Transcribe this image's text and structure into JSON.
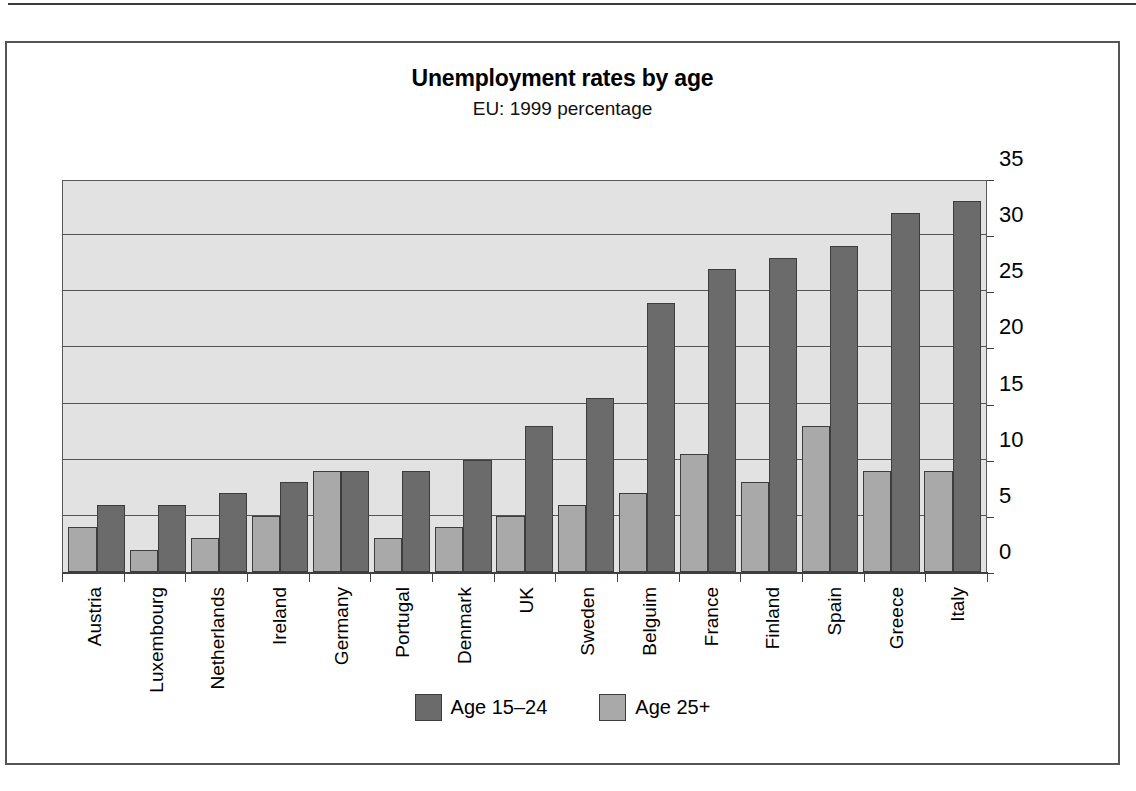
{
  "chart_data": {
    "type": "bar",
    "title": "Unemployment rates by age",
    "subtitle": "EU: 1999 percentage",
    "xlabel": "",
    "ylabel": "",
    "ylim": [
      0,
      35
    ],
    "yticks": [
      0,
      5,
      10,
      15,
      20,
      25,
      30,
      35
    ],
    "grid": true,
    "legend_position": "bottom",
    "categories": [
      "Austria",
      "Luxembourg",
      "Netherlands",
      "Ireland",
      "Germany",
      "Portugal",
      "Denmark",
      "UK",
      "Sweden",
      "Belguim",
      "France",
      "Finland",
      "Spain",
      "Greece",
      "Italy"
    ],
    "series": [
      {
        "name": "Age 25+",
        "color": "#a9a9a9",
        "values": [
          4,
          2,
          3,
          5,
          9,
          3,
          4,
          5,
          6,
          7,
          10.5,
          8,
          13,
          9,
          9
        ]
      },
      {
        "name": "Age 15–24",
        "color": "#6b6b6b",
        "values": [
          6,
          6,
          7,
          8,
          9,
          9,
          10,
          13,
          15.5,
          24,
          27,
          28,
          29,
          32,
          33
        ]
      }
    ]
  },
  "legend": {
    "entries": [
      {
        "label": "Age 15–24",
        "color": "#6b6b6b"
      },
      {
        "label": "Age 25+",
        "color": "#a9a9a9"
      }
    ]
  },
  "colors": {
    "young_bar": "#6b6b6b",
    "older_bar": "#a9a9a9",
    "plot_background": "#e2e2e2",
    "gridline": "#555555",
    "frame": "#545454"
  }
}
